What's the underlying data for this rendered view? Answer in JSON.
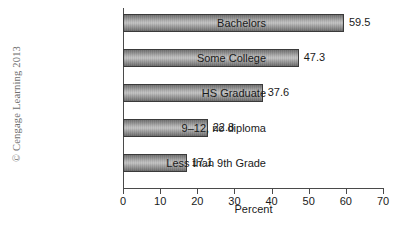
{
  "figure": {
    "background_color": "#ffffff",
    "copyright": "© Cengage Learning 2013"
  },
  "chart_data": {
    "type": "bar",
    "orientation": "horizontal",
    "title": "",
    "xlabel": "Percent",
    "ylabel": "",
    "categories": [
      "Bachelors",
      "Some College",
      "HS Graduate",
      "9–12, no diploma",
      "Less than 9th Grade"
    ],
    "values": [
      59.5,
      47.3,
      37.6,
      22.8,
      17.1
    ],
    "value_labels": [
      "59.5",
      "47.3",
      "37.6",
      "22.8",
      "17.1"
    ],
    "xlim": [
      0,
      70
    ],
    "xticks": [
      0,
      10,
      20,
      30,
      40,
      50,
      60,
      70
    ],
    "xtick_labels": [
      "0",
      "10",
      "20",
      "30",
      "40",
      "50",
      "60",
      "70"
    ],
    "grid": false,
    "legend": null,
    "bar_color": "#a8a8a8",
    "bar_edge_color": "#3a3a3a",
    "axis_color": "#4a4a4a"
  }
}
